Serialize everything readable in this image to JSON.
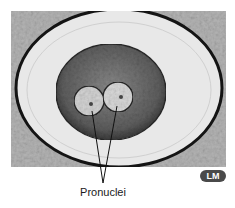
{
  "figure": {
    "label": "Pronuclei",
    "badge": "LM",
    "colors": {
      "background": "#ffffff",
      "tissue_bg": "#b8b8b8",
      "zona": "#e6e6e6",
      "zona_rim": "#141414",
      "cytoplasm": "#6a6a6a",
      "pronucleus": "#d8d8d8",
      "badge_bg": "#4a4a4a",
      "pointer": "#111111"
    }
  }
}
